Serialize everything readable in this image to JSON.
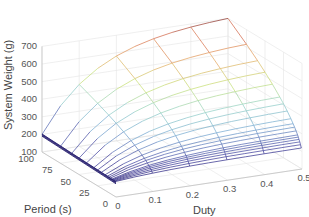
{
  "chart_data": {
    "type": "surface3d",
    "title": "",
    "xlabel": "Duty",
    "ylabel": "Period (s)",
    "zlabel": "System Weight (g)",
    "x_ticks": [
      "0",
      "0.1",
      "0.2",
      "0.3",
      "0.4",
      "0.5"
    ],
    "y_ticks": [
      "0",
      "25",
      "50",
      "75",
      "100"
    ],
    "z_ticks": [
      "100",
      "200",
      "300",
      "400",
      "500",
      "600",
      "700"
    ],
    "xlim": [
      0,
      0.5
    ],
    "ylim": [
      0,
      100
    ],
    "zlim": [
      100,
      700
    ],
    "grid": true,
    "colormap": "jet (mesh edges colored by height)",
    "duty": [
      0,
      0.05,
      0.1,
      0.15,
      0.2,
      0.25,
      0.3,
      0.35,
      0.4,
      0.45,
      0.5
    ],
    "period": [
      1,
      2,
      3,
      4,
      5,
      6,
      8,
      10,
      12,
      15,
      20,
      25,
      30,
      40,
      50,
      60,
      75,
      100
    ],
    "weight_model": "approx: W = 185 + 520*(period/100)^0.6*(1-exp(-duty/0.15))/(1-exp(-0.5/0.15))",
    "corner_values": {
      "duty0_period0": 185,
      "duty0_period100": 200,
      "duty0.5_period0": 230,
      "duty0.5_period100": 700
    }
  }
}
